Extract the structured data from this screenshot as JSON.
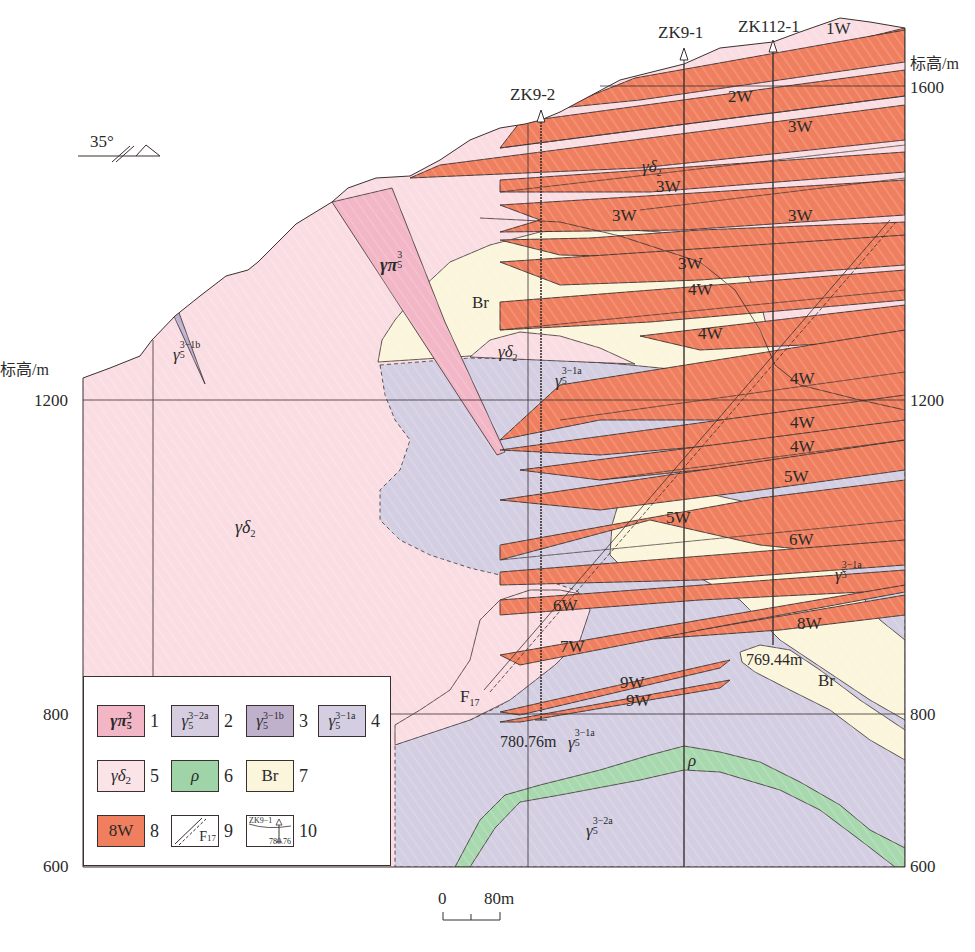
{
  "figure": {
    "type": "geological cross-section",
    "strike_symbol": {
      "dip_label": "35°"
    },
    "axes": {
      "left_title": "标高/m",
      "right_title": "标高/m",
      "left_ticks": [
        "1200",
        "800",
        "600"
      ],
      "right_ticks": [
        "1600",
        "1200",
        "800",
        "600"
      ]
    },
    "scale_bar": {
      "start": "0",
      "end": "80m"
    },
    "boreholes": [
      {
        "id": "ZK9-2",
        "bottom_depth_label": "780.76m"
      },
      {
        "id": "ZK9-1"
      },
      {
        "id": "ZK112-1",
        "bottom_depth_label": "769.44m"
      }
    ],
    "fault": {
      "label": "F",
      "sub": "17"
    },
    "unit_labels": {
      "gd2_main": {
        "base": "γδ",
        "sub": "2"
      },
      "gd2_upper": {
        "base": "γδ",
        "sub": "2"
      },
      "gd2_mid": {
        "base": "γδ",
        "sub": "2"
      },
      "gpi": {
        "base": "γπ",
        "sub": "5",
        "sup": "3"
      },
      "g1b": {
        "base": "γ",
        "sub": "5",
        "sup": "3−1b"
      },
      "g1a_upper": {
        "base": "γ",
        "sub": "5",
        "sup": "3−1a"
      },
      "g1a_right": {
        "base": "γ",
        "sub": "5",
        "sup": "3−1a"
      },
      "g1a_bottom": {
        "base": "γ",
        "sub": "5",
        "sup": "3−1a"
      },
      "g2a": {
        "base": "γ",
        "sub": "5",
        "sup": "3−2a"
      },
      "rho": "ρ",
      "br_upper": "Br",
      "br_lower": "Br"
    },
    "ore_bodies": [
      "1W",
      "2W",
      "3W",
      "3W",
      "3W",
      "3W",
      "3W",
      "4W",
      "4W",
      "4W",
      "4W",
      "4W",
      "5W",
      "5W",
      "6W",
      "6W",
      "7W",
      "8W",
      "9W",
      "9W"
    ],
    "legend": {
      "items": [
        {
          "num": "1",
          "symbol": "γπ",
          "sub": "5",
          "sup": "3",
          "color": "#F2B6C6"
        },
        {
          "num": "2",
          "symbol": "γ",
          "sub": "5",
          "sup": "3−2a",
          "color": "#D6CDE0"
        },
        {
          "num": "3",
          "symbol": "γ",
          "sub": "5",
          "sup": "3−1b",
          "color": "#BFB1CC"
        },
        {
          "num": "4",
          "symbol": "γ",
          "sub": "5",
          "sup": "3−1a",
          "color": "#D4CEE2"
        },
        {
          "num": "5",
          "symbol": "γδ",
          "sub": "2",
          "color": "#FBE4E8"
        },
        {
          "num": "6",
          "symbol": "ρ",
          "color": "#9FD4A8"
        },
        {
          "num": "7",
          "symbol": "Br",
          "color": "#FBF5DC"
        },
        {
          "num": "8",
          "symbol": "8W",
          "color": "#EF7F5E"
        },
        {
          "num": "9",
          "symbol": "F",
          "sub": "17",
          "color": "#FFFFFF"
        },
        {
          "num": "10",
          "symbol": "ZK9−1",
          "sub": "780.76",
          "color": "#FFFFFF"
        }
      ]
    },
    "colors": {
      "gd2": "#FADDE3",
      "gpi": "#F2B6C6",
      "g1a": "#D3CEE2",
      "g1b": "#BDB0CE",
      "g2a": "#D6CDE0",
      "rho": "#A7D8AE",
      "br": "#FBF5DC",
      "ore": "#EF7F5E",
      "line": "#3a3030"
    }
  }
}
